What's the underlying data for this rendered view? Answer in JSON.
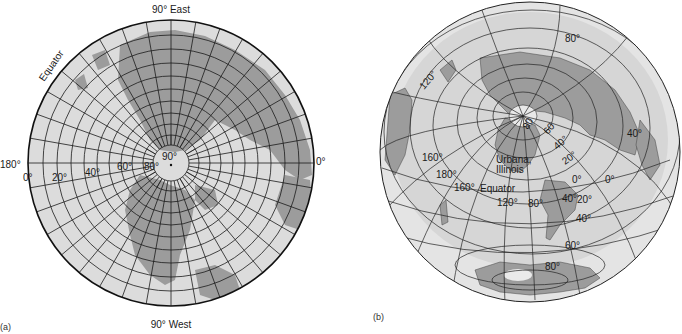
{
  "figure": {
    "panels": [
      {
        "id": "a",
        "panel_label": "(a)",
        "projection": "polar azimuthal (north pole centered)",
        "labels": {
          "top": "90° East",
          "bottom": "90° West",
          "left": "180°",
          "right": "0°",
          "equator": "Equator",
          "center": "90°",
          "lat_80": "80°",
          "lat_60": "60°",
          "lat_40": "40°",
          "lat_20": "20°",
          "lat_0": "0°"
        }
      },
      {
        "id": "b",
        "panel_label": "(b)",
        "projection": "azimuthal centered on Urbana, Illinois",
        "labels": {
          "city": "Urbana,",
          "state": "Illinois",
          "equator": "Equator",
          "lon_120_top": "120°",
          "lon_160": "160°",
          "lon_180": "180°",
          "lon_160_b": "160°",
          "lon_120": "120°",
          "lon_80": "80°",
          "lon_40": "40°",
          "lon_0": "0°",
          "lon_0_right": "0°",
          "lat_80_top": "80°",
          "lat_60": "60",
          "lat_80n": "80",
          "lat_40n": "40°",
          "lat_20n": "20°",
          "lat_40_east": "40°",
          "lat_20s": "20°",
          "lat_40s": "40°",
          "lat_60s": "60°",
          "lat_80s": "80°"
        }
      }
    ],
    "colors": {
      "ocean": "#d9d9d9",
      "land": "#9a9a9a",
      "grid": "#1a1a1a",
      "outer_ring": "#e6e6e6"
    }
  }
}
